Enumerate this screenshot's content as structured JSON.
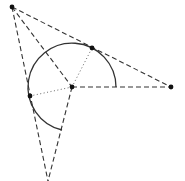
{
  "diagram": {
    "colors": {
      "line": "#333333",
      "point": "#111111",
      "background": "#ffffff"
    },
    "center": {
      "x": 72,
      "y": 87
    },
    "radius": 44,
    "points": [
      {
        "id": "A",
        "role": "external-point-top-left",
        "x": 12,
        "y": 7
      },
      {
        "id": "O",
        "role": "circle-center",
        "x": 72,
        "y": 87
      },
      {
        "id": "B",
        "role": "right-point",
        "x": 171,
        "y": 87
      },
      {
        "id": "T1",
        "role": "tangent-point-top",
        "x": 92,
        "y": 48
      },
      {
        "id": "T2",
        "role": "tangent-point-left",
        "x": 30,
        "y": 96
      }
    ],
    "arc": {
      "start": {
        "x": 116,
        "y": 87
      },
      "end": {
        "x": 62,
        "y": 130
      },
      "direction": "counterclockwise-through-top"
    },
    "dashed_segments": [
      {
        "from": "A",
        "to": "B",
        "x1": 12,
        "y1": 7,
        "x2": 171,
        "y2": 87
      },
      {
        "from": "A",
        "to": "O",
        "x1": 12,
        "y1": 7,
        "x2": 72,
        "y2": 87
      },
      {
        "from": "A",
        "to": "C",
        "x1": 12,
        "y1": 7,
        "x2": 48,
        "y2": 181
      },
      {
        "from": "O",
        "to": "B",
        "x1": 72,
        "y1": 87,
        "x2": 171,
        "y2": 87
      },
      {
        "from": "O",
        "to": "C",
        "x1": 72,
        "y1": 87,
        "x2": 48,
        "y2": 181
      }
    ],
    "dotted_segments": [
      {
        "from": "O",
        "to": "T1",
        "x1": 72,
        "y1": 87,
        "x2": 92,
        "y2": 48
      },
      {
        "from": "O",
        "to": "T2",
        "x1": 72,
        "y1": 87,
        "x2": 30,
        "y2": 96
      }
    ]
  }
}
